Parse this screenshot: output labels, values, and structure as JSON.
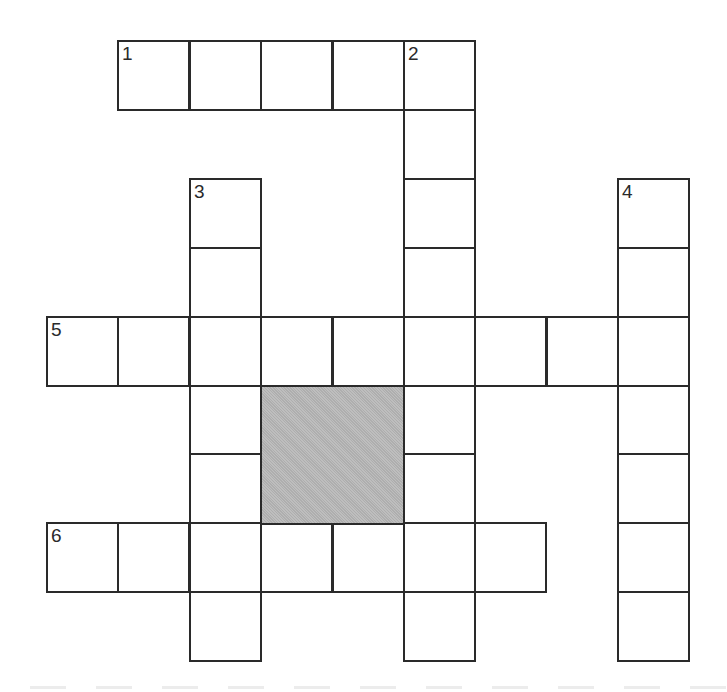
{
  "puzzle": {
    "grid": {
      "origin_x": 46,
      "origin_y": 40,
      "cell_w": 71.4,
      "cell_h": 68.9,
      "cols": 9,
      "rows": 9
    },
    "colors": {
      "line": "#2a2a2a",
      "cell_fill": "#ffffff",
      "shaded_fill": "#b9b9b9",
      "background": "#ffffff"
    },
    "clues": [
      {
        "number": "1",
        "direction": "across",
        "row": 0,
        "col": 1,
        "length": 5
      },
      {
        "number": "2",
        "direction": "down",
        "row": 0,
        "col": 5,
        "length": 9
      },
      {
        "number": "3",
        "direction": "down",
        "row": 2,
        "col": 2,
        "length": 7
      },
      {
        "number": "4",
        "direction": "down",
        "row": 2,
        "col": 8,
        "length": 7
      },
      {
        "number": "5",
        "direction": "across",
        "row": 4,
        "col": 0,
        "length": 9
      },
      {
        "number": "6",
        "direction": "across",
        "row": 7,
        "col": 0,
        "length": 7
      }
    ],
    "shaded_block": {
      "row": 5,
      "col": 3,
      "rows": 2,
      "cols": 2
    },
    "entries": {}
  }
}
